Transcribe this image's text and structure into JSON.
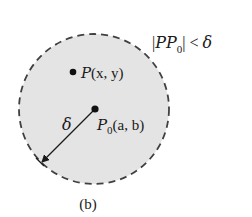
{
  "diagram": {
    "caption": "(b)",
    "condition": {
      "abs_bar_left": "|",
      "expr": "PP",
      "sub": "0",
      "abs_bar_right": "|",
      "rel": "<",
      "rhs": "δ"
    },
    "disk": {
      "fill": "#e4e4e4",
      "border_style": "dashed",
      "border_color": "#404040"
    },
    "point_p": {
      "name": "P",
      "coords": "(x, y)"
    },
    "center_point": {
      "name": "P",
      "sub": "0",
      "coords": "(a, b)"
    },
    "radius_label": "δ"
  }
}
